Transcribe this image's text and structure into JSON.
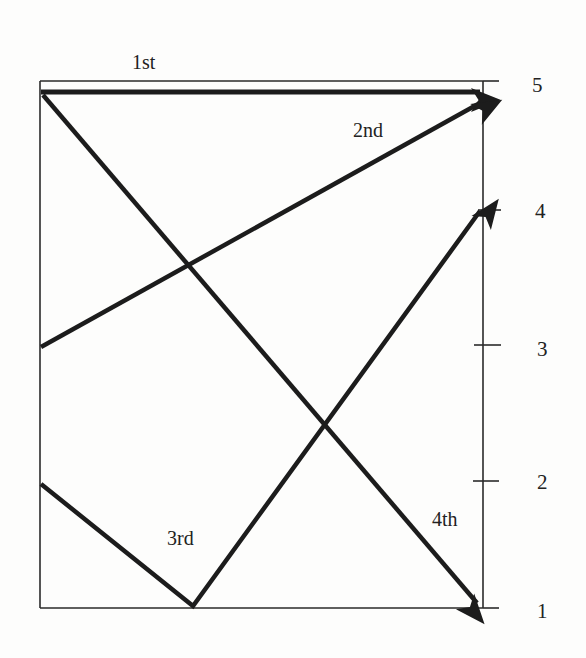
{
  "diagram": {
    "colors": {
      "stroke": "#1c1c1c",
      "frame": "#2a2a2a",
      "background": "#fdfdfc",
      "text": "#222222"
    },
    "axis": {
      "ticks": [
        {
          "label": "5",
          "y": 81
        },
        {
          "label": "4",
          "y": 210
        },
        {
          "label": "3",
          "y": 345
        },
        {
          "label": "2",
          "y": 481
        },
        {
          "label": "1",
          "y": 608
        }
      ]
    },
    "arrows": [
      {
        "label": "1st",
        "points": [
          [
            41,
            92
          ],
          [
            481,
            92
          ]
        ]
      },
      {
        "label": "2nd",
        "points": [
          [
            41,
            347
          ],
          [
            481,
            102
          ]
        ]
      },
      {
        "label": "3rd",
        "points": [
          [
            41,
            484
          ],
          [
            193,
            606
          ],
          [
            481,
            210
          ]
        ]
      },
      {
        "label": "4th",
        "points": [
          [
            43,
            95
          ],
          [
            478,
            604
          ]
        ]
      }
    ],
    "labels": {
      "first": "1st",
      "second": "2nd",
      "third": "3rd",
      "fourth": "4th",
      "tick5": "5",
      "tick4": "4",
      "tick3": "3",
      "tick2": "2",
      "tick1": "1"
    }
  }
}
